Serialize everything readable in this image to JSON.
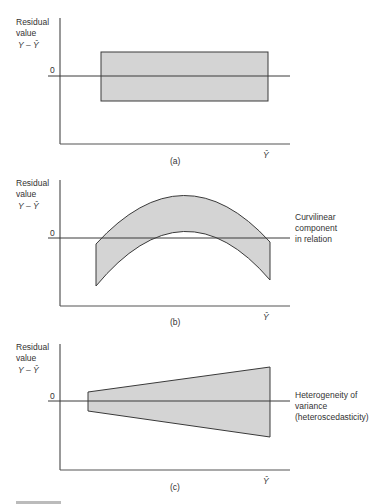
{
  "figure": {
    "panels": [
      {
        "id": "a",
        "caption": "(a)",
        "y_label_line1": "Residual",
        "y_label_line2": "value",
        "y_label_line3": "Y – Ŷ",
        "zero_label": "0",
        "x_label": "Ŷ",
        "annotation": ""
      },
      {
        "id": "b",
        "caption": "(b)",
        "y_label_line1": "Residual",
        "y_label_line2": "value",
        "y_label_line3": "Y – Ŷ",
        "zero_label": "0",
        "x_label": "Ŷ",
        "annotation_line1": "Curvilinear",
        "annotation_line2": "component",
        "annotation_line3": "in relation"
      },
      {
        "id": "c",
        "caption": "(c)",
        "y_label_line1": "Residual",
        "y_label_line2": "value",
        "y_label_line3": "Y – Ŷ",
        "zero_label": "0",
        "x_label": "Ŷ",
        "annotation_line1": "Heterogeneity of",
        "annotation_line2": "variance",
        "annotation_line3": "(heteroscedasticity)"
      }
    ],
    "colors": {
      "fill": "#d4d4d4",
      "stroke": "#3a3a3a",
      "axis": "#555555"
    }
  }
}
